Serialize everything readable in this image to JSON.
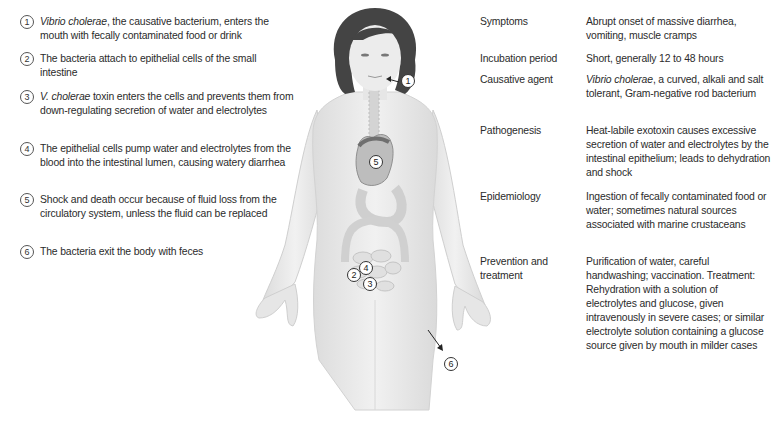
{
  "steps": [
    {
      "num": "1",
      "italic": "Vibrio cholerae",
      "text": ", the causative bacterium, enters the mouth with fecally contaminated food or drink"
    },
    {
      "num": "2",
      "italic": "",
      "text": "The bacteria attach to epithelial cells of the small intestine"
    },
    {
      "num": "3",
      "italic": "V. cholerae",
      "text": " toxin enters the cells and prevents them from down-regulating secretion of water and electrolytes"
    },
    {
      "num": "4",
      "italic": "",
      "text": "The epithelial cells pump water and electrolytes from the blood into the intestinal lumen, causing watery diarrhea"
    },
    {
      "num": "5",
      "italic": "",
      "text": "Shock and death occur because of fluid loss from the circulatory system, unless the fluid can be replaced"
    },
    {
      "num": "6",
      "italic": "",
      "text": "The bacteria exit the body with feces"
    }
  ],
  "table": [
    {
      "label": "Symptoms",
      "italic": "",
      "value": "Abrupt onset of massive diarrhea, vomiting, muscle cramps"
    },
    {
      "label": "Incubation period",
      "italic": "",
      "value": "Short, generally 12 to 48 hours"
    },
    {
      "label": "Causative agent",
      "italic": "Vibrio cholerae",
      "value": ", a curved, alkali and salt tolerant, Gram-negative rod bacterium"
    },
    {
      "label": "Pathogenesis",
      "italic": "",
      "value": "Heat-labile exotoxin causes excessive secretion of water and electrolytes by the intestinal epithelium; leads to dehydration and shock"
    },
    {
      "label": "Epidemiology",
      "italic": "",
      "value": "Ingestion of fecally contaminated food or water; sometimes natural sources associated with marine crustaceans"
    },
    {
      "label": "Prevention and treatment",
      "italic": "",
      "value": "Purification of water, careful handwashing; vaccination. Treatment: Rehydration with a solution of electrolytes and glucose, given intravenously in severe cases; or similar electrolyte solution containing a glucose source given by mouth in milder cases"
    }
  ],
  "figure": {
    "callouts": [
      {
        "num": "1",
        "target": "mouth"
      },
      {
        "num": "2",
        "target": "small-intestine"
      },
      {
        "num": "3",
        "target": "intestinal-cells"
      },
      {
        "num": "4",
        "target": "intestinal-lumen"
      },
      {
        "num": "5",
        "target": "heart"
      },
      {
        "num": "6",
        "target": "exit-feces"
      }
    ]
  }
}
